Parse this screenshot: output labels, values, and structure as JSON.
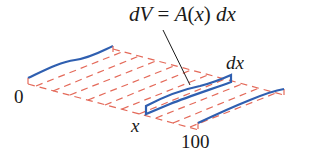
{
  "diagram": {
    "formula": {
      "lhs": "dV",
      "eq": " = ",
      "fn": "A",
      "paren_open": "(",
      "var": "x",
      "paren_close": ")",
      "space": " ",
      "rhs": "dx"
    },
    "labels": {
      "start": "0",
      "end": "100",
      "position": "x",
      "thickness": "dx"
    },
    "colors": {
      "curve": "#2f5fb0",
      "grid": "#e46a5a",
      "text": "#1a1a1a",
      "leader": "#1a1a1a"
    }
  }
}
